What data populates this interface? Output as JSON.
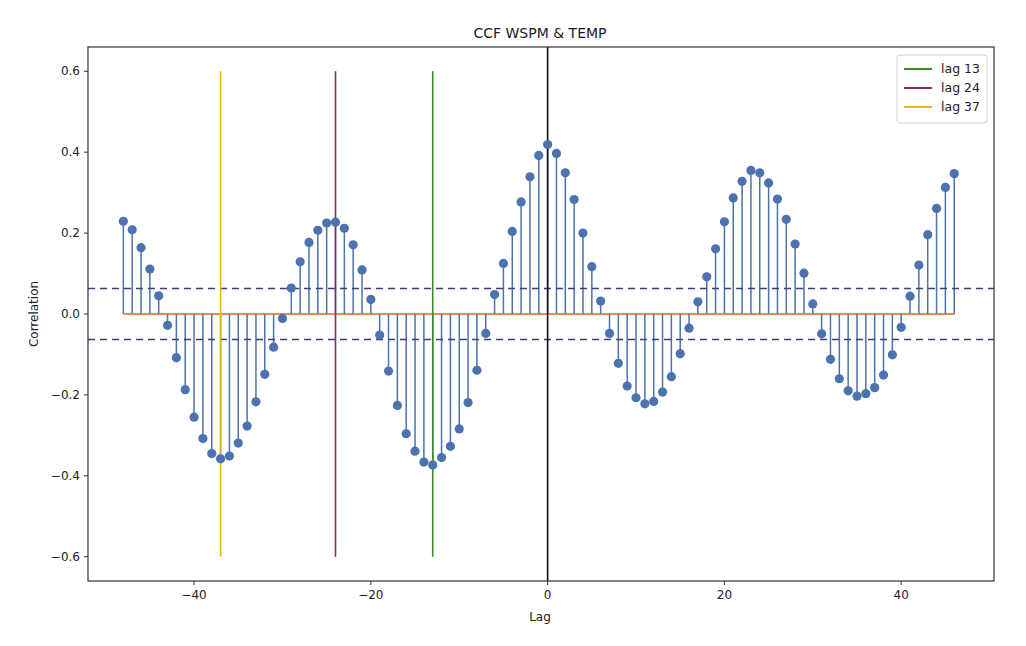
{
  "chart_data": {
    "type": "stem",
    "title": "CCF WSPM & TEMP",
    "xlabel": "Lag",
    "ylabel": "Correlation",
    "xlim": [
      -52,
      50.5
    ],
    "ylim": [
      -0.66,
      0.66
    ],
    "xticks": [
      -40,
      -20,
      0,
      20,
      40
    ],
    "xtick_labels": [
      "−40",
      "−20",
      "0",
      "20",
      "40"
    ],
    "yticks": [
      0.6,
      0.4,
      0.2,
      0.0,
      -0.2,
      -0.4,
      -0.6
    ],
    "ytick_labels": [
      "0.6",
      "0.4",
      "0.2",
      "0.0",
      "−0.2",
      "−0.4",
      "−0.6"
    ],
    "grid": false,
    "legend_position": "upper right",
    "series": [
      {
        "name": "ccf",
        "type": "stem",
        "color": "#4c72b0",
        "baseline_color": "#e0622a",
        "x": [
          -48,
          -47,
          -46,
          -45,
          -44,
          -43,
          -42,
          -41,
          -40,
          -39,
          -38,
          -37,
          -36,
          -35,
          -34,
          -33,
          -32,
          -31,
          -30,
          -29,
          -28,
          -27,
          -26,
          -25,
          -24,
          -23,
          -22,
          -21,
          -20,
          -19,
          -18,
          -17,
          -16,
          -15,
          -14,
          -13,
          -12,
          -11,
          -10,
          -9,
          -8,
          -7,
          -6,
          -5,
          -4,
          -3,
          -2,
          -1,
          0,
          1,
          2,
          3,
          4,
          5,
          6,
          7,
          8,
          9,
          10,
          11,
          12,
          13,
          14,
          15,
          16,
          17,
          18,
          19,
          20,
          21,
          22,
          23,
          24,
          25,
          26,
          27,
          28,
          29,
          30,
          31,
          32,
          33,
          34,
          35,
          36,
          37,
          38,
          39,
          40,
          41,
          42,
          43,
          44,
          45,
          46
        ],
        "values": [
          0.229,
          0.208,
          0.164,
          0.111,
          0.045,
          -0.028,
          -0.108,
          -0.187,
          -0.255,
          -0.308,
          -0.345,
          -0.358,
          -0.351,
          -0.319,
          -0.277,
          -0.217,
          -0.149,
          -0.082,
          -0.011,
          0.064,
          0.129,
          0.177,
          0.207,
          0.225,
          0.227,
          0.212,
          0.171,
          0.109,
          0.036,
          -0.052,
          -0.141,
          -0.226,
          -0.296,
          -0.339,
          -0.366,
          -0.373,
          -0.355,
          -0.327,
          -0.284,
          -0.219,
          -0.139,
          -0.048,
          0.048,
          0.125,
          0.204,
          0.277,
          0.339,
          0.392,
          0.419,
          0.397,
          0.349,
          0.283,
          0.2,
          0.117,
          0.032,
          -0.048,
          -0.122,
          -0.178,
          -0.207,
          -0.222,
          -0.216,
          -0.193,
          -0.155,
          -0.098,
          -0.035,
          0.03,
          0.092,
          0.161,
          0.228,
          0.287,
          0.328,
          0.355,
          0.349,
          0.324,
          0.284,
          0.234,
          0.173,
          0.101,
          0.025,
          -0.049,
          -0.112,
          -0.16,
          -0.19,
          -0.203,
          -0.197,
          -0.182,
          -0.151,
          -0.101,
          -0.033,
          0.044,
          0.121,
          0.196,
          0.261,
          0.313,
          0.347
        ]
      }
    ],
    "confidence_bands": {
      "upper": 0.063,
      "lower": -0.063,
      "color": "#3b3f7a",
      "style": "dashed"
    },
    "zero_line": {
      "x": 0,
      "color": "#111111"
    },
    "vlines": [
      {
        "label": "lag 13",
        "x": -13,
        "ymin": -0.6,
        "ymax": 0.6,
        "color": "#3a8a2a"
      },
      {
        "label": "lag 24",
        "x": -24,
        "ymin": -0.6,
        "ymax": 0.6,
        "color": "#8a2a6a"
      },
      {
        "label": "lag 37",
        "x": -37,
        "ymin": -0.6,
        "ymax": 0.6,
        "color": "#e6b422"
      }
    ]
  },
  "legend": {
    "items": [
      {
        "label": "lag 13",
        "color": "#3a8a2a"
      },
      {
        "label": "lag 24",
        "color": "#8a2a6a"
      },
      {
        "label": "lag 37",
        "color": "#e6b422"
      }
    ]
  }
}
